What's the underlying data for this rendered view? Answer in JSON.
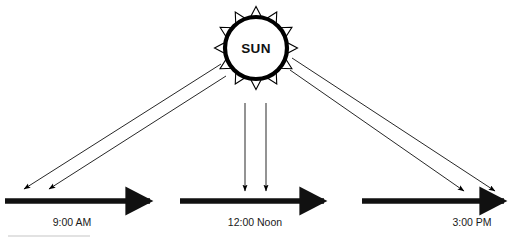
{
  "diagram": {
    "sun": {
      "label": "SUN",
      "center_x": 256,
      "center_y": 48,
      "radius": 31,
      "ray_count": 12,
      "outline_color": "#000000",
      "fill_color": "#ffffff"
    },
    "timelines": [
      {
        "id": "morning",
        "label": "9:00 AM",
        "bar_x1": 5,
        "bar_x2": 158,
        "bar_y": 201,
        "label_x": 72,
        "label_y": 223
      },
      {
        "id": "noon",
        "label": "12:00 Noon",
        "bar_x1": 180,
        "bar_x2": 332,
        "bar_y": 201,
        "label_x": 255,
        "label_y": 223
      },
      {
        "id": "afternoon",
        "label": "3:00 PM",
        "bar_x1": 362,
        "bar_x2": 512,
        "bar_y": 201,
        "label_x": 472,
        "label_y": 223
      }
    ],
    "ray_arrows": [
      {
        "id": "morning-ray-1",
        "x1": 221,
        "y1": 64,
        "x2": 22,
        "y2": 190
      },
      {
        "id": "morning-ray-2",
        "x1": 226,
        "y1": 76,
        "x2": 47,
        "y2": 190
      },
      {
        "id": "noon-ray-1",
        "x1": 245,
        "y1": 103,
        "x2": 245,
        "y2": 192
      },
      {
        "id": "noon-ray-2",
        "x1": 266,
        "y1": 103,
        "x2": 266,
        "y2": 192
      },
      {
        "id": "afternoon-ray-1",
        "x1": 292,
        "y1": 58,
        "x2": 497,
        "y2": 192
      },
      {
        "id": "afternoon-ray-2",
        "x1": 290,
        "y1": 70,
        "x2": 466,
        "y2": 192
      }
    ],
    "footer_rule": {
      "x1": 8,
      "x2": 90,
      "y": 236,
      "color": "#d8d8d8"
    },
    "colors": {
      "stroke": "#000000",
      "bar": "#111111",
      "background": "#ffffff",
      "faint_rule": "#d8d8d8"
    }
  }
}
